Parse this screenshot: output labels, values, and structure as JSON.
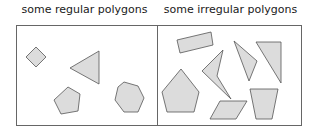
{
  "panels": [
    {
      "title": "some regular polygons"
    },
    {
      "title": "some irregular polygons"
    }
  ],
  "colors": {
    "fill": "#dcdcdc",
    "stroke": "#555555",
    "frame": "#666666"
  }
}
